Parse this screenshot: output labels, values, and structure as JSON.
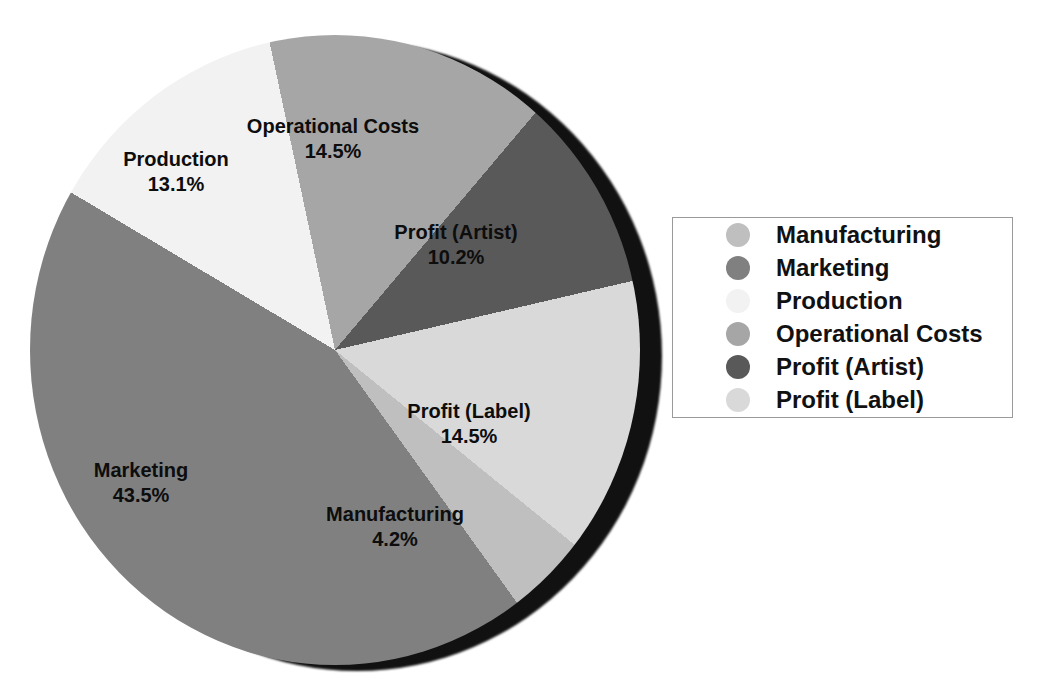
{
  "page": {
    "background": "#ffffff"
  },
  "chart_data": {
    "type": "pie",
    "title": "",
    "categories": [
      "Manufacturing",
      "Marketing",
      "Production",
      "Operational Costs",
      "Profit (Artist)",
      "Profit (Label)"
    ],
    "values": [
      4.2,
      43.5,
      13.1,
      14.5,
      10.2,
      14.5
    ],
    "unit": "%",
    "colors": [
      "#bfbfbf",
      "#808080",
      "#f2f2f2",
      "#a6a6a6",
      "#595959",
      "#d9d9d9"
    ],
    "clockwise": true,
    "start_angle_deg": -12,
    "draw_order": [
      "Operational Costs",
      "Profit (Artist)",
      "Profit (Label)",
      "Manufacturing",
      "Marketing",
      "Production"
    ],
    "shadow_color": "#111111",
    "slice_labels": [
      {
        "name": "Operational Costs",
        "pct": "14.5%",
        "x": 333,
        "y": 139
      },
      {
        "name": "Profit (Artist)",
        "pct": "10.2%",
        "x": 456,
        "y": 245
      },
      {
        "name": "Profit (Label)",
        "pct": "14.5%",
        "x": 469,
        "y": 424
      },
      {
        "name": "Manufacturing",
        "pct": "4.2%",
        "x": 395,
        "y": 527
      },
      {
        "name": "Marketing",
        "pct": "43.5%",
        "x": 141,
        "y": 483
      },
      {
        "name": "Production",
        "pct": "13.1%",
        "x": 176,
        "y": 172
      }
    ],
    "legend": {
      "position": "right",
      "border_color": "#9a9a9a",
      "entries": [
        {
          "label": "Manufacturing",
          "color": "#bfbfbf"
        },
        {
          "label": "Marketing",
          "color": "#808080"
        },
        {
          "label": "Production",
          "color": "#f2f2f2"
        },
        {
          "label": "Operational Costs",
          "color": "#a6a6a6"
        },
        {
          "label": "Profit (Artist)",
          "color": "#595959"
        },
        {
          "label": "Profit (Label)",
          "color": "#d9d9d9"
        }
      ]
    }
  }
}
